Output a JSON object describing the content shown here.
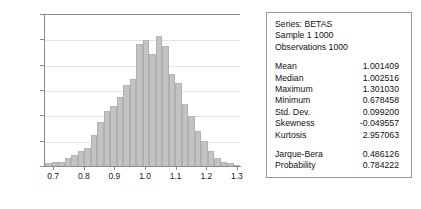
{
  "chart_data": {
    "type": "bar",
    "title": "",
    "xlabel": "",
    "ylabel": "",
    "ylim": [
      0,
      120
    ],
    "yticks": [
      0,
      20,
      40,
      60,
      80,
      100,
      120
    ],
    "xlim": [
      0.67,
      1.31
    ],
    "xticks": [
      0.7,
      0.8,
      0.9,
      1.0,
      1.1,
      1.2,
      1.3
    ],
    "xtick_labels": [
      "0.7",
      "0.8",
      "0.9",
      "1.0",
      "1.1",
      "1.2",
      "1.3"
    ],
    "ytick_labels": [
      "0",
      "20",
      "40",
      "60",
      "80",
      "100",
      "120"
    ],
    "grid": true,
    "bin_centers": [
      0.69,
      0.711,
      0.732,
      0.753,
      0.774,
      0.795,
      0.817,
      0.838,
      0.859,
      0.88,
      0.901,
      0.922,
      0.943,
      0.964,
      0.985,
      1.007,
      1.028,
      1.049,
      1.07,
      1.091,
      1.112,
      1.133,
      1.154,
      1.175,
      1.197,
      1.218,
      1.239,
      1.26,
      1.281,
      1.302
    ],
    "values": [
      2,
      3,
      3,
      6,
      9,
      12,
      14,
      25,
      35,
      44,
      48,
      55,
      64,
      69,
      97,
      100,
      89,
      103,
      95,
      73,
      66,
      49,
      40,
      28,
      20,
      12,
      6,
      3,
      2,
      1
    ],
    "bar_color": "#c3c3c3",
    "bar_edge_color": "#b0b0b0",
    "axis_color": "#8c8c8c",
    "gridline_color": "#e2e2e2"
  },
  "stats": {
    "header": [
      "Series: BETAS",
      "Sample 1 1000",
      "Observations 1000"
    ],
    "rows_primary": [
      {
        "label": "Mean",
        "value": "1.001409"
      },
      {
        "label": "Median",
        "value": "1.002516"
      },
      {
        "label": "Maximum",
        "value": "1.301030"
      },
      {
        "label": "Minimum",
        "value": "0.678458"
      },
      {
        "label": "Std. Dev.",
        "value": "0.099200"
      },
      {
        "label": "Skewness",
        "value": "-0.049557"
      },
      {
        "label": "Kurtosis",
        "value": "2.957063"
      }
    ],
    "rows_tests": [
      {
        "label": "Jarque-Bera",
        "value": "0.486126"
      },
      {
        "label": "Probability",
        "value": "0.784222"
      }
    ]
  }
}
